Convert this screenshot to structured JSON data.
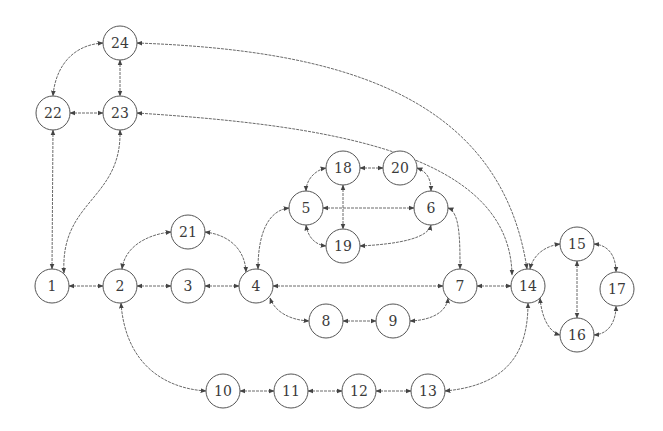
{
  "diagram": {
    "type": "undirected-graph-bidirectional-arrows",
    "node_radius": 17,
    "stroke_color": "#555555",
    "edge_color": "#6a6a6a",
    "nodes": [
      {
        "id": "1",
        "label": "1",
        "x": 52,
        "y": 286
      },
      {
        "id": "2",
        "label": "2",
        "x": 120,
        "y": 286
      },
      {
        "id": "3",
        "label": "3",
        "x": 188,
        "y": 286
      },
      {
        "id": "4",
        "label": "4",
        "x": 256,
        "y": 286
      },
      {
        "id": "5",
        "label": "5",
        "x": 306,
        "y": 208
      },
      {
        "id": "6",
        "label": "6",
        "x": 431,
        "y": 208
      },
      {
        "id": "7",
        "label": "7",
        "x": 460,
        "y": 286
      },
      {
        "id": "8",
        "label": "8",
        "x": 326,
        "y": 321
      },
      {
        "id": "9",
        "label": "9",
        "x": 393,
        "y": 321
      },
      {
        "id": "10",
        "label": "10",
        "x": 223,
        "y": 391
      },
      {
        "id": "11",
        "label": "11",
        "x": 291,
        "y": 391
      },
      {
        "id": "12",
        "label": "12",
        "x": 359,
        "y": 391
      },
      {
        "id": "13",
        "label": "13",
        "x": 428,
        "y": 391
      },
      {
        "id": "14",
        "label": "14",
        "x": 528,
        "y": 286
      },
      {
        "id": "15",
        "label": "15",
        "x": 577,
        "y": 244
      },
      {
        "id": "16",
        "label": "16",
        "x": 577,
        "y": 335
      },
      {
        "id": "17",
        "label": "17",
        "x": 617,
        "y": 289
      },
      {
        "id": "18",
        "label": "18",
        "x": 343,
        "y": 168
      },
      {
        "id": "19",
        "label": "19",
        "x": 343,
        "y": 246
      },
      {
        "id": "20",
        "label": "20",
        "x": 400,
        "y": 168
      },
      {
        "id": "21",
        "label": "21",
        "x": 188,
        "y": 232
      },
      {
        "id": "22",
        "label": "22",
        "x": 53,
        "y": 113
      },
      {
        "id": "23",
        "label": "23",
        "x": 120,
        "y": 113
      },
      {
        "id": "24",
        "label": "24",
        "x": 120,
        "y": 43
      }
    ],
    "edges": [
      {
        "from": "24",
        "to": "22",
        "path": "M103,43 C70,45 55,70 53,96"
      },
      {
        "from": "24",
        "to": "23",
        "path": "M120,60 L120,96"
      },
      {
        "from": "22",
        "to": "23",
        "path": "M70,113 L103,113"
      },
      {
        "from": "22",
        "to": "1",
        "path": "M53,130 L52,269"
      },
      {
        "from": "23",
        "to": "1",
        "path": "M120,130 C122,200 60,200 64,273"
      },
      {
        "from": "24",
        "to": "14",
        "path": "M137,43 C330,50 500,90 527,269"
      },
      {
        "from": "23",
        "to": "14",
        "path": "M137,113 C320,125 510,150 512,275"
      },
      {
        "from": "1",
        "to": "2",
        "path": "M69,286 L103,286"
      },
      {
        "from": "2",
        "to": "3",
        "path": "M137,286 L171,286"
      },
      {
        "from": "3",
        "to": "4",
        "path": "M205,286 L239,286"
      },
      {
        "from": "2",
        "to": "21",
        "path": "M122,269 C125,245 150,234 171,232"
      },
      {
        "from": "21",
        "to": "4",
        "path": "M205,232 C230,235 245,250 246,272"
      },
      {
        "from": "4",
        "to": "5",
        "path": "M258,269 C258,230 270,210 289,208"
      },
      {
        "from": "4",
        "to": "7",
        "path": "M273,286 L443,286"
      },
      {
        "from": "4",
        "to": "8",
        "path": "M270,298 C275,312 290,320 309,321"
      },
      {
        "from": "8",
        "to": "9",
        "path": "M343,321 L376,321"
      },
      {
        "from": "9",
        "to": "7",
        "path": "M410,321 C435,320 447,310 448,298"
      },
      {
        "from": "7",
        "to": "14",
        "path": "M477,286 L511,286"
      },
      {
        "from": "6",
        "to": "7",
        "path": "M448,208 C460,212 460,240 460,269"
      },
      {
        "from": "5",
        "to": "6",
        "path": "M323,208 L414,208"
      },
      {
        "from": "5",
        "to": "18",
        "path": "M306,191 C306,180 315,170 326,168"
      },
      {
        "from": "5",
        "to": "19",
        "path": "M306,225 C308,238 316,245 326,246"
      },
      {
        "from": "18",
        "to": "19",
        "path": "M343,185 L343,229"
      },
      {
        "from": "18",
        "to": "20",
        "path": "M360,168 L383,168"
      },
      {
        "from": "20",
        "to": "6",
        "path": "M417,168 C428,172 431,180 431,191"
      },
      {
        "from": "19",
        "to": "6",
        "path": "M360,246 C400,244 428,238 431,225"
      },
      {
        "from": "2",
        "to": "10",
        "path": "M121,303 C125,360 160,388 206,391"
      },
      {
        "from": "10",
        "to": "11",
        "path": "M240,391 L274,391"
      },
      {
        "from": "11",
        "to": "12",
        "path": "M308,391 L342,391"
      },
      {
        "from": "12",
        "to": "13",
        "path": "M376,391 L411,391"
      },
      {
        "from": "13",
        "to": "14",
        "path": "M445,391 C510,385 528,350 528,303"
      },
      {
        "from": "14",
        "to": "15",
        "path": "M530,269 C533,255 545,246 560,244"
      },
      {
        "from": "14",
        "to": "16",
        "path": "M540,298 C542,320 550,332 560,335"
      },
      {
        "from": "15",
        "to": "16",
        "path": "M577,261 L577,318"
      },
      {
        "from": "15",
        "to": "17",
        "path": "M594,244 C610,245 616,258 616,272"
      },
      {
        "from": "16",
        "to": "17",
        "path": "M594,335 C610,334 616,320 616,306"
      }
    ]
  }
}
